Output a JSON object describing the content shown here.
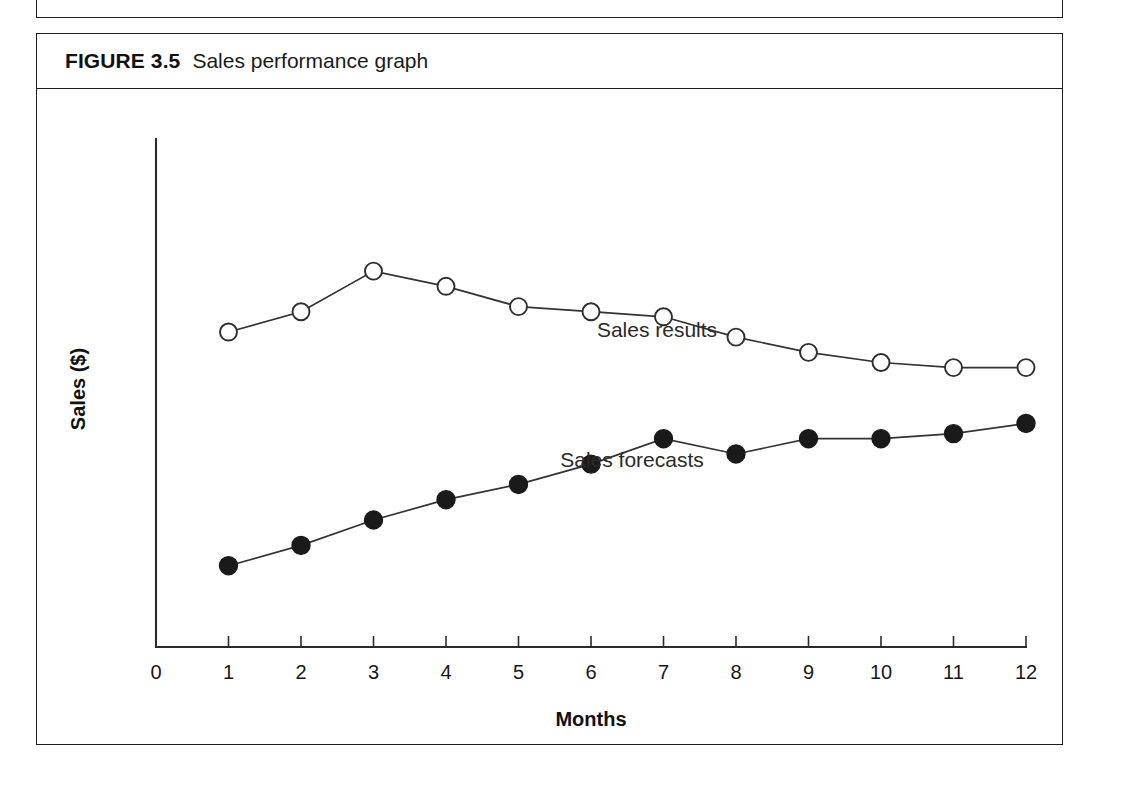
{
  "figure": {
    "number": "FIGURE 3.5",
    "title": "Sales performance graph"
  },
  "chart_data": {
    "type": "line",
    "title": "Sales performance graph",
    "xlabel": "Months",
    "ylabel": "Sales ($)",
    "x": [
      1,
      2,
      3,
      4,
      5,
      6,
      7,
      8,
      9,
      10,
      11,
      12
    ],
    "xtick_labels": [
      "0",
      "1",
      "2",
      "3",
      "4",
      "5",
      "6",
      "7",
      "8",
      "9",
      "10",
      "11",
      "12"
    ],
    "xlim": [
      0,
      12
    ],
    "ylim": [
      0,
      100
    ],
    "ytick_labels": [],
    "grid": false,
    "legend_position": "inline-annotation",
    "series": [
      {
        "name": "Sales results",
        "marker": "open-circle",
        "values": [
          62,
          66,
          74,
          71,
          67,
          66,
          65,
          61,
          58,
          56,
          55,
          55
        ],
        "annotation": "Sales results"
      },
      {
        "name": "Sales forecasts",
        "marker": "filled-circle",
        "values": [
          16,
          20,
          25,
          29,
          32,
          36,
          41,
          38,
          41,
          41,
          42,
          44
        ],
        "annotation": "Sales forecasts"
      }
    ]
  }
}
